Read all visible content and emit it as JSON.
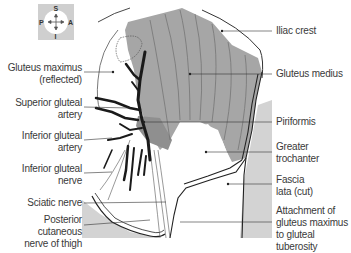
{
  "compass": {
    "north": "S",
    "south": "I",
    "west": "P",
    "east": "A"
  },
  "labels_left": [
    {
      "id": "gluteus-maximus",
      "line1": "Gluteus maximus",
      "line2": "(reflected)"
    },
    {
      "id": "superior-gluteal-artery",
      "line1": "Superior gluteal",
      "line2": "artery"
    },
    {
      "id": "inferior-gluteal-artery",
      "line1": "Inferior gluteal",
      "line2": "artery"
    },
    {
      "id": "inferior-gluteal-nerve",
      "line1": "Inferior gluteal",
      "line2": "nerve"
    },
    {
      "id": "sciatic-nerve",
      "line1": "Sciatic nerve",
      "line2": ""
    },
    {
      "id": "posterior-cutaneous-nerve",
      "line1": "Posterior cutaneous",
      "line2": "nerve of thigh"
    }
  ],
  "labels_right": [
    {
      "id": "iliac-crest",
      "line1": "Iliac crest",
      "line2": "",
      "line3": ""
    },
    {
      "id": "gluteus-medius",
      "line1": "Gluteus medius",
      "line2": "",
      "line3": ""
    },
    {
      "id": "piriformis",
      "line1": "Piriformis",
      "line2": "",
      "line3": ""
    },
    {
      "id": "greater-trochanter",
      "line1": "Greater",
      "line2": "trochanter",
      "line3": ""
    },
    {
      "id": "fascia-lata",
      "line1": "Fascia",
      "line2": "lata (cut)",
      "line3": ""
    },
    {
      "id": "attachment-gluteus-maximus",
      "line1": "Attachment of",
      "line2": "gluteus maximus",
      "line3": "to gluteal tuberosity"
    }
  ],
  "colors": {
    "muscle_gray": "#a6a6a6",
    "fascia_gray": "#d0d0d0",
    "vessel_black": "#1a1a1a",
    "label_text": "#3a3a3a"
  }
}
